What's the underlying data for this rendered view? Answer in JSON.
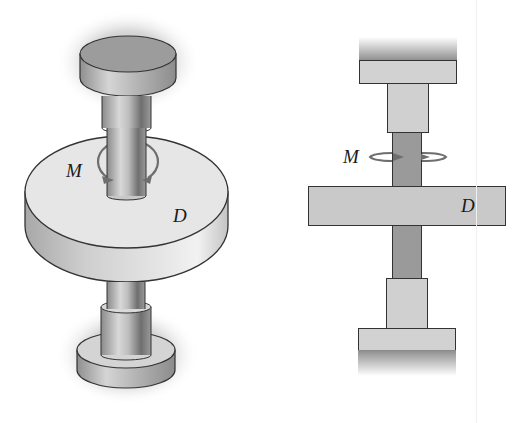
{
  "figure": {
    "left_view": {
      "title": "isometric-view",
      "labels": {
        "moment": "M",
        "disk": "D"
      }
    },
    "right_view": {
      "title": "side-view",
      "labels": {
        "moment": "M",
        "disk": "D"
      }
    },
    "colors": {
      "disk_top": "#e4e4e4",
      "disk_side": "#c8c8c8",
      "shaft": "#9a9a9a",
      "shaft_dark": "#8a8a8a",
      "block": "#d0d0d0",
      "cap_top": "#9c9c9c",
      "outline": "#333333",
      "arrow": "#6e6e6e"
    }
  }
}
